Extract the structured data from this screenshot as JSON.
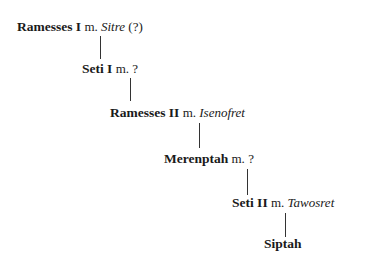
{
  "diagram": {
    "title": "",
    "type": "family-tree",
    "nodes": [
      {
        "name": "Ramesses I",
        "marker": "m.",
        "spouse": "Sitre",
        "note": "(?)"
      },
      {
        "name": "Seti I",
        "marker": "m.",
        "spouse": "",
        "note": "?"
      },
      {
        "name": "Ramesses II",
        "marker": "m.",
        "spouse": "Isenofret",
        "note": ""
      },
      {
        "name": "Merenptah",
        "marker": "m.",
        "spouse": "",
        "note": "?"
      },
      {
        "name": "Seti II",
        "marker": "m.",
        "spouse": "Tawosret",
        "note": ""
      },
      {
        "name": "Siptah",
        "marker": "",
        "spouse": "",
        "note": ""
      }
    ],
    "edges": [
      {
        "from": "Ramesses I",
        "to": "Seti I"
      },
      {
        "from": "Seti I",
        "to": "Ramesses II"
      },
      {
        "from": "Ramesses II",
        "to": "Merenptah"
      },
      {
        "from": "Merenptah",
        "to": "Seti II"
      },
      {
        "from": "Seti II",
        "to": "Siptah"
      }
    ]
  }
}
